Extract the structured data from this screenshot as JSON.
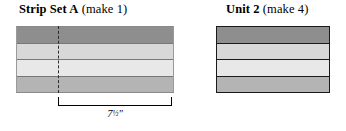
{
  "diagram": {
    "background_color": "#ffffff",
    "fabric_colors": {
      "dark_gray": "#8e8e8e",
      "light_gray": "#d8d8d8",
      "lightest_gray": "#e8e8e8",
      "medium_gray": "#b4b4b4",
      "seam_line": "#1a1a1a",
      "cut_line": "#2b2b2b"
    }
  },
  "strip_set_a": {
    "title_main": "Strip Set A",
    "title_note": "(make 1)",
    "bands": [
      {
        "label": "strip-1",
        "color": "#8e8e8e"
      },
      {
        "label": "strip-2",
        "color": "#d8d8d8"
      },
      {
        "label": "strip-3",
        "color": "#e8e8e8"
      },
      {
        "label": "strip-4",
        "color": "#b4b4b4"
      }
    ],
    "cut_line": {
      "style": "dashed",
      "orientation": "vertical"
    },
    "measurement": {
      "whole": "7",
      "fraction": "1/2",
      "unit": "″",
      "display": "7½″"
    }
  },
  "unit_2": {
    "title_main": "Unit 2",
    "title_note": "(make 4)",
    "bands": [
      {
        "label": "strip-1",
        "color": "#8e8e8e"
      },
      {
        "label": "strip-2",
        "color": "#d8d8d8"
      },
      {
        "label": "strip-3",
        "color": "#e8e8e8"
      },
      {
        "label": "strip-4",
        "color": "#b4b4b4"
      }
    ]
  }
}
